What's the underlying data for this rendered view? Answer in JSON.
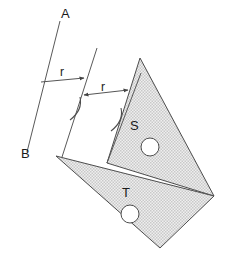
{
  "figure": {
    "background_color": "#ffffff",
    "width": 232,
    "height": 267,
    "line_color": "#595959",
    "fill_color": "#e8e8e8",
    "stipple_color": "#b8b8b8",
    "text_color": "#1a1a1a",
    "labels": {
      "point_a": "A",
      "point_b": "B",
      "shape_s": "S",
      "shape_t": "T",
      "distance_1": "r",
      "distance_2": "r"
    },
    "label_positions": {
      "point_a": {
        "x": 61,
        "y": 18
      },
      "point_b": {
        "x": 21,
        "y": 158
      },
      "shape_s": {
        "x": 130,
        "y": 130
      },
      "shape_t": {
        "x": 122,
        "y": 197
      },
      "distance_1": {
        "x": 60,
        "y": 76
      },
      "distance_2": {
        "x": 101,
        "y": 91
      }
    },
    "mirror_lines": [
      {
        "name": "axis-ab",
        "x1": 60,
        "y1": 21,
        "x2": 27,
        "y2": 152
      },
      {
        "name": "axis-mid",
        "x1": 97,
        "y1": 48,
        "x2": 62,
        "y2": 157
      },
      {
        "name": "axis-right",
        "x1": 141,
        "y1": 73,
        "x2": 107,
        "y2": 163
      }
    ],
    "dimensions": [
      {
        "name": "r-first",
        "label": "r",
        "x1": 41,
        "y1": 82,
        "x2": 85,
        "y2": 78,
        "arrow_start": false,
        "arrow_end": true
      },
      {
        "name": "r-second",
        "label": "r",
        "x1": 83,
        "y1": 95,
        "x2": 129,
        "y2": 90,
        "arrow_start": true,
        "arrow_end": true
      }
    ],
    "tick_arcs": [
      {
        "name": "tick-mid",
        "x": 76,
        "y": 106
      },
      {
        "name": "tick-right",
        "x": 117,
        "y": 117
      }
    ],
    "shapes": [
      {
        "name": "triangle-s",
        "label": "S",
        "points": "140,58 214,196 107,163",
        "hole": {
          "cx": 150,
          "cy": 147,
          "r": 9
        }
      },
      {
        "name": "triangle-t",
        "label": "T",
        "points": "56,156 214,196 160,248",
        "hole": {
          "cx": 130,
          "cy": 214,
          "r": 9
        }
      }
    ]
  }
}
